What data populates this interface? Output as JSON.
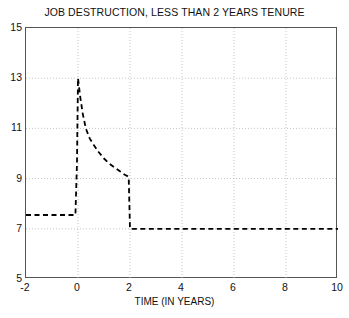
{
  "chart_data": {
    "type": "line",
    "title": "JOB DESTRUCTION, LESS THAN 2 YEARS TENURE",
    "xlabel": "TIME (IN YEARS)",
    "ylabel": "",
    "xlim": [
      -2,
      10
    ],
    "ylim": [
      5,
      15
    ],
    "xticks": [
      -2,
      0,
      2,
      4,
      6,
      8,
      10
    ],
    "xtick_labels": [
      "-2",
      "0",
      "2",
      "4",
      "6",
      "8",
      "10"
    ],
    "yticks": [
      5,
      7,
      9,
      11,
      13,
      15
    ],
    "ytick_labels": [
      "5",
      "7",
      "9",
      "11",
      "13",
      "15"
    ],
    "grid": true,
    "grid_style": "dotted",
    "grid_color": "#b8b8b8",
    "line_style": "dashed",
    "line_color": "#000000",
    "line_width": 1.8,
    "legend": null,
    "series": [
      {
        "name": "job destruction rate",
        "x": [
          -2.0,
          -0.1,
          -0.04,
          0.0,
          0.08,
          0.18,
          0.3,
          0.45,
          0.6,
          0.8,
          1.0,
          1.2,
          1.4,
          1.6,
          1.8,
          1.9,
          1.95,
          2.0,
          2.0,
          4.0,
          6.0,
          8.0,
          10.0
        ],
        "y": [
          7.55,
          7.55,
          9.6,
          13.0,
          12.3,
          11.6,
          11.0,
          10.6,
          10.35,
          10.05,
          9.8,
          9.6,
          9.45,
          9.3,
          9.15,
          9.1,
          9.05,
          7.0,
          7.0,
          7.0,
          7.0,
          7.0,
          7.0
        ]
      }
    ],
    "annotations": []
  }
}
